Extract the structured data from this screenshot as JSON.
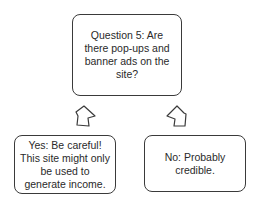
{
  "diagram": {
    "question_box": {
      "text": "Question 5: Are there pop-ups and banner ads on the site?"
    },
    "yes_box": {
      "text": "Yes: Be careful! This site might only be used to generate income."
    },
    "no_box": {
      "text": "No: Probably credible."
    },
    "arrows": [
      {
        "name": "arrow-to-yes",
        "direction": "down-left"
      },
      {
        "name": "arrow-to-no",
        "direction": "down-right"
      }
    ]
  }
}
